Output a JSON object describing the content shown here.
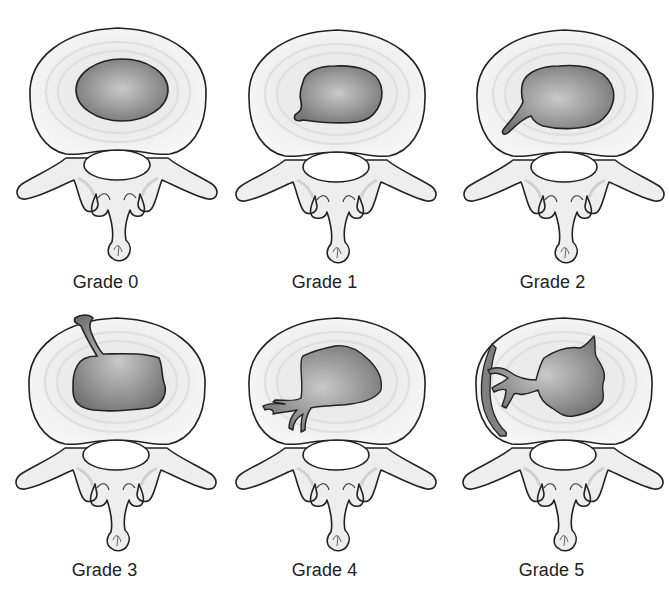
{
  "figure": {
    "colors": {
      "background": "#ffffff",
      "outline": "#222222",
      "annulus": "#f3f3f3",
      "annulus_ring": "#e2e2e2",
      "nucleus_center": "#c8c8c8",
      "nucleus_edge": "#7a7a7a",
      "bone": "#f0f0f0",
      "bone_shade": "#d6d6d6",
      "label_text": "#222222"
    },
    "panels": [
      {
        "grade": 0,
        "label": "Grade 0",
        "row": 0,
        "col": 0,
        "description": "Normal disc, intact oval nucleus"
      },
      {
        "grade": 1,
        "label": "Grade 1",
        "row": 0,
        "col": 1,
        "description": "Small radial extension of nucleus"
      },
      {
        "grade": 2,
        "label": "Grade 2",
        "row": 0,
        "col": 2,
        "description": "Fissure extends into inner annulus"
      },
      {
        "grade": 3,
        "label": "Grade 3",
        "row": 1,
        "col": 0,
        "description": "Fissure reaches outer annulus edge"
      },
      {
        "grade": 4,
        "label": "Grade 4",
        "row": 1,
        "col": 1,
        "description": "Fissure spreads circumferentially at outer annulus"
      },
      {
        "grade": 5,
        "label": "Grade 5",
        "row": 1,
        "col": 2,
        "description": "Full-thickness tear with extensive circumferential spread"
      }
    ]
  }
}
